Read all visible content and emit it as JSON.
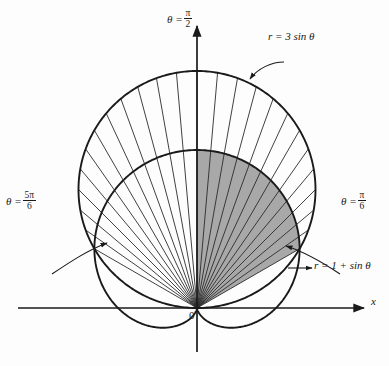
{
  "figure": {
    "kind": "polar-plot",
    "background_color": "#fdfdfd",
    "stroke_color": "#1a1a1a",
    "shade_color": "#a8a8a8",
    "origin_label": "0",
    "x_axis_label": "x",
    "axis_theta_label": {
      "lhs": "θ =",
      "num": "π",
      "den": "2"
    },
    "angle_left": {
      "lhs": "θ =",
      "num": "5π",
      "den": "6"
    },
    "angle_right": {
      "lhs": "θ =",
      "num": "π",
      "den": "6"
    },
    "curve_circle_label": "r = 3 sin θ",
    "curve_cardioid_label": "r = 1 + sin θ"
  },
  "chart_data": {
    "type": "line",
    "title": "",
    "xlabel": "x",
    "ylabel": "",
    "coordinate_system": "polar",
    "grid": false,
    "legend": "inline-annotations",
    "origin_px": [
      197,
      308
    ],
    "unit_px": 79,
    "series": [
      {
        "name": "r = 3 sin θ",
        "equation": "r = 3 sin(theta)",
        "shape": "circle",
        "center_polar": [
          1.5,
          1.5707963
        ],
        "radius_units": 1.5,
        "center_px": [
          197,
          189
        ],
        "radius_px": 119,
        "theta_range": [
          0,
          3.14159265
        ]
      },
      {
        "name": "r = 1 + sin θ",
        "equation": "r = 1 + sin(theta)",
        "shape": "cardioid",
        "max_r_units": 2,
        "min_r_units": 0,
        "cusp_theta": 4.71238898,
        "theta_range": [
          0,
          6.28318531
        ]
      }
    ],
    "intersections": [
      {
        "theta": 0.52359878,
        "theta_label": "π/6",
        "r": 1.5,
        "px": [
          292,
          253
        ]
      },
      {
        "theta": 2.61799388,
        "theta_label": "5π/6",
        "r": 1.5,
        "px": [
          102,
          253
        ]
      },
      {
        "theta": 4.71238898,
        "theta_label": "3π/2",
        "r": 0,
        "px": [
          197,
          308
        ]
      }
    ],
    "shaded_region": {
      "description": "region inside cardioid r = 1 + sin theta between theta = pi/6 and theta = pi/2",
      "theta_from": 0.52359878,
      "theta_to": 1.5707963,
      "bounding_curve": "r = 1 + sin θ",
      "fill": "#a8a8a8"
    },
    "radial_lines": {
      "description": "radial spokes from origin out to the bounding curve",
      "count": 24,
      "theta_start": 0.52359878,
      "theta_end": 2.61799388
    },
    "annotations": [
      {
        "text": "θ = π/2",
        "at_px": [
          197,
          18
        ],
        "points_to": "positive y axis"
      },
      {
        "text": "r = 3 sin θ",
        "at_px": [
          300,
          36
        ],
        "points_to": [
          250,
          78
        ]
      },
      {
        "text": "θ = 5π/6",
        "at_px": [
          30,
          200
        ],
        "points_to": [
          102,
          253
        ]
      },
      {
        "text": "θ = π/6",
        "at_px": [
          360,
          200
        ],
        "points_to": [
          292,
          253
        ]
      },
      {
        "text": "r = 1 + sin θ",
        "at_px": [
          345,
          268
        ],
        "points_to": [
          295,
          268
        ]
      },
      {
        "text": "0",
        "at_px": [
          192,
          316
        ],
        "points_to": "origin"
      },
      {
        "text": "x",
        "at_px": [
          374,
          302
        ],
        "points_to": "positive x axis"
      }
    ]
  }
}
